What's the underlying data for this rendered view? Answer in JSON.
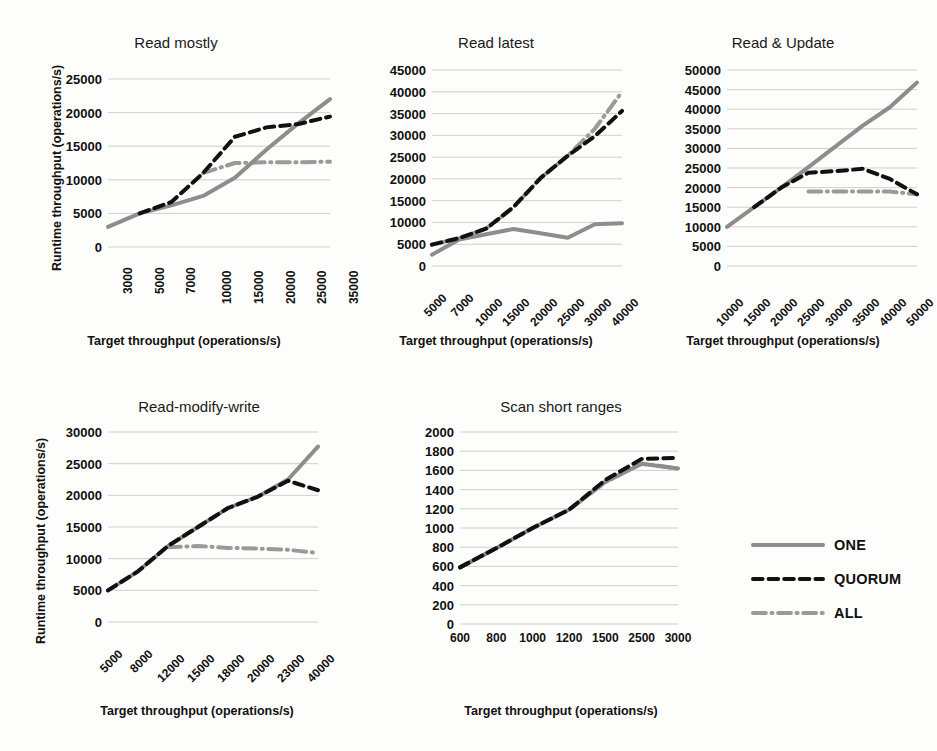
{
  "figure": {
    "background": "#fdfdfb",
    "axis_label_x": "Target throughput (operations/s)",
    "axis_label_y": "Runtime throughput (operations/s)"
  },
  "series_style": {
    "ONE": {
      "color": "#8d8d8d",
      "dash": "none",
      "width": 4
    },
    "QUORUM": {
      "color": "#111111",
      "dash": "dashed",
      "width": 4
    },
    "ALL": {
      "color": "#9a9a9a",
      "dash": "dashdot",
      "width": 4
    }
  },
  "legend": {
    "position": "bottom-right",
    "items": [
      {
        "name": "ONE",
        "label": "ONE",
        "color": "#8d8d8d",
        "style": "solid"
      },
      {
        "name": "QUORUM",
        "label": "QUORUM",
        "color": "#111111",
        "style": "dashed"
      },
      {
        "name": "ALL",
        "label": "ALL",
        "color": "#9a9a9a",
        "style": "dashdot"
      }
    ]
  },
  "chart_data": [
    {
      "id": "read-mostly",
      "type": "line",
      "title": "Read mostly",
      "xlabel": "Target throughput (operations/s)",
      "ylabel": "Runtime throughput (operations/s)",
      "categories": [
        "3000",
        "5000",
        "7000",
        "10000",
        "15000",
        "20000",
        "25000",
        "35000"
      ],
      "ylim": [
        0,
        25000
      ],
      "yticks": [
        0,
        5000,
        10000,
        15000,
        20000,
        25000
      ],
      "grid": true,
      "tick_rotation": 90,
      "series": [
        {
          "name": "ONE",
          "values": [
            3000,
            5000,
            6200,
            7600,
            10300,
            14500,
            18400,
            22000
          ]
        },
        {
          "name": "QUORUM",
          "values": [
            null,
            5000,
            6700,
            11000,
            16400,
            17800,
            18300,
            19400
          ]
        },
        {
          "name": "ALL",
          "values": [
            null,
            null,
            null,
            11000,
            12500,
            12600,
            12600,
            12700
          ]
        }
      ]
    },
    {
      "id": "read-latest",
      "type": "line",
      "title": "Read latest",
      "xlabel": "Target throughput (operations/s)",
      "ylabel": "",
      "categories": [
        "5000",
        "7000",
        "10000",
        "15000",
        "20000",
        "25000",
        "30000",
        "40000"
      ],
      "ylim": [
        0,
        45000
      ],
      "yticks": [
        0,
        5000,
        10000,
        15000,
        20000,
        25000,
        30000,
        35000,
        40000,
        45000
      ],
      "grid": true,
      "tick_rotation": 45,
      "series": [
        {
          "name": "ONE",
          "values": [
            2600,
            6100,
            7300,
            8500,
            7500,
            6500,
            9600,
            9800
          ]
        },
        {
          "name": "QUORUM",
          "values": [
            4900,
            6400,
            8600,
            13500,
            20200,
            25300,
            29800,
            35600
          ]
        },
        {
          "name": "ALL",
          "values": [
            4900,
            6400,
            8600,
            13500,
            20200,
            25300,
            31500,
            40000
          ]
        }
      ]
    },
    {
      "id": "read-and-update",
      "type": "line",
      "title": "Read & Update",
      "xlabel": "Target throughput (operations/s)",
      "ylabel": "",
      "categories": [
        "10000",
        "15000",
        "20000",
        "25000",
        "30000",
        "35000",
        "40000",
        "50000"
      ],
      "ylim": [
        0,
        50000
      ],
      "yticks": [
        0,
        5000,
        10000,
        15000,
        20000,
        25000,
        30000,
        35000,
        40000,
        45000,
        50000
      ],
      "grid": true,
      "tick_rotation": 45,
      "series": [
        {
          "name": "ONE",
          "values": [
            10000,
            15000,
            20000,
            25200,
            30500,
            35800,
            40500,
            46800
          ]
        },
        {
          "name": "QUORUM",
          "values": [
            null,
            15000,
            20000,
            23800,
            24200,
            24800,
            22200,
            18300
          ]
        },
        {
          "name": "ALL",
          "values": [
            null,
            null,
            null,
            19000,
            19000,
            19000,
            19000,
            18300
          ]
        }
      ]
    },
    {
      "id": "read-modify-write",
      "type": "line",
      "title": "Read-modify-write",
      "xlabel": "Target throughput (operations/s)",
      "ylabel": "Runtime throughput (operations/s)",
      "categories": [
        "5000",
        "8000",
        "12000",
        "15000",
        "18000",
        "20000",
        "23000",
        "40000"
      ],
      "ylim": [
        0,
        30000
      ],
      "yticks": [
        0,
        5000,
        10000,
        15000,
        20000,
        25000,
        30000
      ],
      "grid": true,
      "tick_rotation": 45,
      "series": [
        {
          "name": "ONE",
          "values": [
            5000,
            8000,
            12000,
            15000,
            18000,
            19800,
            22500,
            27700
          ]
        },
        {
          "name": "QUORUM",
          "values": [
            5000,
            8000,
            12000,
            15000,
            18000,
            19800,
            22300,
            20800
          ]
        },
        {
          "name": "ALL",
          "values": [
            null,
            null,
            11800,
            12000,
            11700,
            11600,
            11400,
            10900
          ]
        }
      ]
    },
    {
      "id": "scan-short-ranges",
      "type": "line",
      "title": "Scan short ranges",
      "xlabel": "Target throughput (operations/s)",
      "ylabel": "",
      "categories": [
        "600",
        "800",
        "1000",
        "1200",
        "1500",
        "2500",
        "3000"
      ],
      "ylim": [
        0,
        2000
      ],
      "yticks": [
        0,
        200,
        400,
        600,
        800,
        1000,
        1200,
        1400,
        1600,
        1800,
        2000
      ],
      "grid": true,
      "tick_rotation": 0,
      "series": [
        {
          "name": "ONE",
          "values": [
            590,
            790,
            1000,
            1190,
            1480,
            1670,
            1620
          ]
        },
        {
          "name": "QUORUM",
          "values": [
            590,
            790,
            1000,
            1190,
            1500,
            1720,
            1730
          ]
        },
        {
          "name": "ALL",
          "values": [
            590,
            790,
            1000,
            1190,
            1480,
            1670,
            1620
          ]
        }
      ]
    }
  ]
}
